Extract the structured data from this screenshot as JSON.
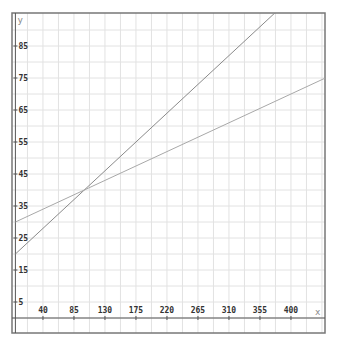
{
  "chart_data": {
    "type": "line",
    "title": "",
    "xlabel": "x",
    "ylabel": "y",
    "xlim": [
      0,
      449
    ],
    "ylim": [
      -5,
      95
    ],
    "grid": true,
    "x_ticks": [
      40,
      85,
      130,
      175,
      220,
      265,
      310,
      355,
      400
    ],
    "y_ticks": [
      5,
      15,
      25,
      35,
      45,
      55,
      65,
      75,
      85
    ],
    "series": [
      {
        "name": "line-1",
        "equation": "y = 0.2x + 20",
        "slope": 0.2,
        "intercept": 20,
        "color": "#8a8a8a"
      },
      {
        "name": "line-2",
        "equation": "y = 0.1x + 30",
        "slope": 0.1,
        "intercept": 30,
        "color": "#a8a8a8"
      }
    ],
    "intersection": {
      "x": 100,
      "y": 40
    }
  },
  "colors": {
    "grid": "#e2e2e2",
    "frame": "#777777",
    "axis": "#555555"
  }
}
